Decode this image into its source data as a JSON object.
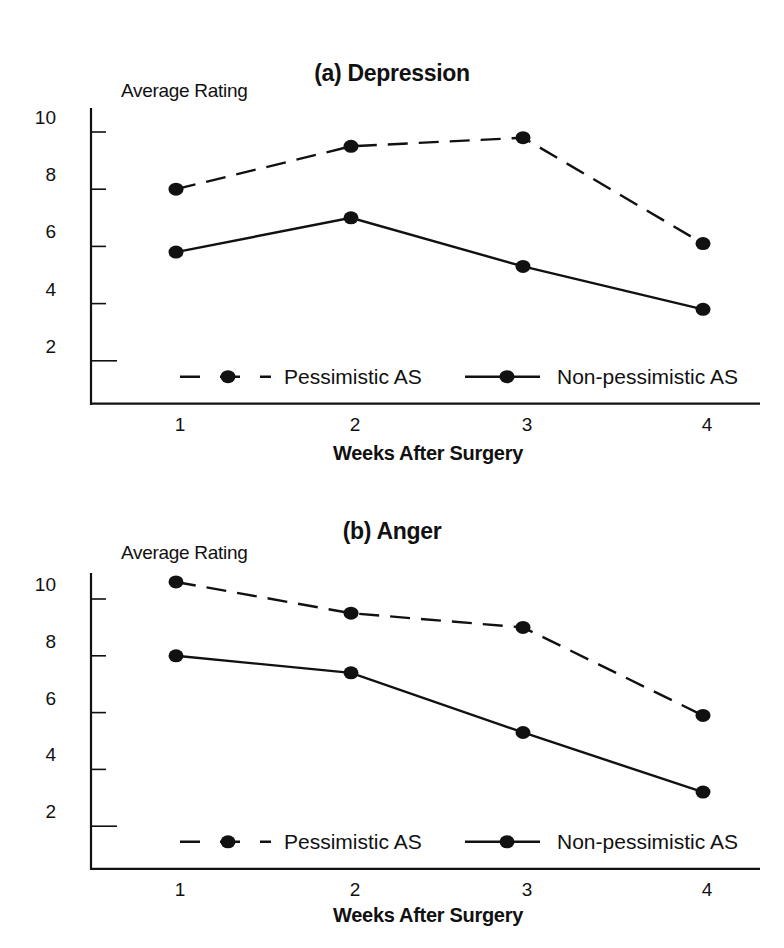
{
  "chart_data": [
    {
      "type": "line",
      "title": "(a) Depression",
      "xlabel": "Weeks After Surgery",
      "ylabel": "Average Rating",
      "x": [
        1,
        2,
        3,
        4
      ],
      "categories": [
        "1",
        "2",
        "3",
        "4"
      ],
      "yticks": [
        2,
        4,
        6,
        8,
        10
      ],
      "ylim": [
        0.5,
        10.5
      ],
      "grid": false,
      "legend_position": "bottom-inside",
      "series": [
        {
          "name": "Pessimistic AS",
          "style": "dashed",
          "values": [
            8.0,
            9.5,
            9.8,
            6.1
          ]
        },
        {
          "name": "Non-pessimistic AS",
          "style": "solid",
          "values": [
            5.8,
            7.0,
            5.3,
            3.8
          ]
        }
      ]
    },
    {
      "type": "line",
      "title": "(b) Anger",
      "xlabel": "Weeks After Surgery",
      "ylabel": "Average Rating",
      "x": [
        1,
        2,
        3,
        4
      ],
      "categories": [
        "1",
        "2",
        "3",
        "4"
      ],
      "yticks": [
        2,
        4,
        6,
        8,
        10
      ],
      "ylim": [
        0.5,
        10.5
      ],
      "grid": false,
      "legend_position": "bottom-inside",
      "series": [
        {
          "name": "Pessimistic AS",
          "style": "dashed",
          "values": [
            10.6,
            9.5,
            9.0,
            5.9
          ]
        },
        {
          "name": "Non-pessimistic AS",
          "style": "solid",
          "values": [
            8.0,
            7.4,
            5.3,
            3.2
          ]
        }
      ]
    }
  ],
  "colors": {
    "line": "#111111",
    "background": "#ffffff"
  }
}
